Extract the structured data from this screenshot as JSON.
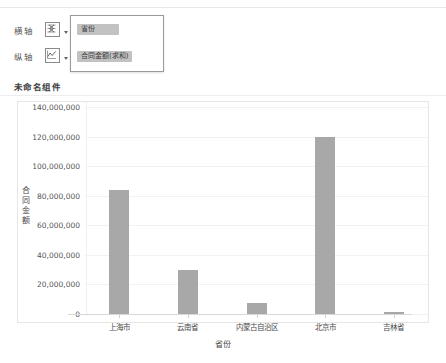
{
  "panel": {
    "x_axis_label": "横轴",
    "y_axis_label": "纵轴",
    "x_axis_icon": "bar-chart-icon",
    "y_axis_icon": "line-chart-icon",
    "x_field_pill": "省份",
    "y_field_pill": "合同金额(求和)",
    "component_title": "未命名组件"
  },
  "chart_data": {
    "type": "bar",
    "title": "未命名组件",
    "xlabel": "省份",
    "ylabel": "合同金额",
    "categories": [
      "上海市",
      "云南省",
      "内蒙古自治区",
      "北京市",
      "吉林省"
    ],
    "values": [
      84000000,
      30000000,
      7500000,
      120000000,
      1200000
    ],
    "ylim": [
      0,
      140000000
    ],
    "ytick_labels": [
      "0",
      "20,000,000",
      "40,000,000",
      "60,000,000",
      "80,000,000",
      "100,000,000",
      "120,000,000",
      "140,000,000"
    ],
    "ytick_values": [
      0,
      20000000,
      40000000,
      60000000,
      80000000,
      100000000,
      120000000,
      140000000
    ],
    "grid": true,
    "legend": "none",
    "bar_color": "#a8a8a8"
  }
}
